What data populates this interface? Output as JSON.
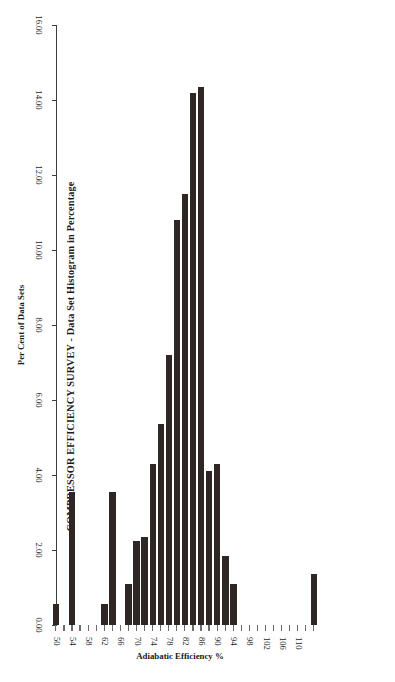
{
  "title": "COMPRESSOR EFFICIENCY SURVEY - Data Set Histogram in Percentage",
  "caption": "Figure 15-1. Efficiency Survey in the Installed Base of Integral Units in the US Gas Transmission Industry.",
  "chart_data": {
    "type": "bar",
    "orientation": "horizontal",
    "title": "COMPRESSOR EFFICIENCY SURVEY - Data Set Histogram in Percentage",
    "xlabel": "Adiabatic Efficiency %",
    "ylabel": "Per Cent of Data Sets",
    "categories": [
      50,
      52,
      54,
      56,
      58,
      60,
      62,
      64,
      66,
      68,
      70,
      72,
      74,
      76,
      78,
      80,
      82,
      84,
      86,
      88,
      90,
      92,
      94,
      96,
      98,
      100,
      102,
      104,
      106,
      108,
      110,
      112,
      114
    ],
    "category_tick_labels": [
      "50",
      "54",
      "58",
      "62",
      "66",
      "70",
      "74",
      "78",
      "82",
      "86",
      "90",
      "94",
      "98",
      "102",
      "106",
      "110"
    ],
    "values": [
      0.55,
      0.0,
      3.55,
      0.0,
      0.0,
      0.0,
      0.55,
      3.55,
      0.0,
      1.1,
      2.25,
      2.35,
      4.3,
      5.35,
      7.2,
      10.8,
      11.5,
      14.2,
      14.35,
      4.1,
      4.3,
      1.85,
      1.1,
      0.0,
      0.0,
      0.0,
      0.0,
      0.0,
      0.0,
      0.0,
      0.0,
      0.0,
      1.35
    ],
    "value_tick_labels": [
      "0.00",
      "2.00",
      "4.00",
      "6.00",
      "8.00",
      "10.00",
      "12.00",
      "14.00",
      "16.00"
    ],
    "value_ticks": [
      0,
      2,
      4,
      6,
      8,
      10,
      12,
      14,
      16
    ],
    "xlim": [
      50,
      114
    ],
    "ylim": [
      0,
      16
    ],
    "grid": false,
    "legend": false,
    "bar_color": "#2e2724"
  }
}
